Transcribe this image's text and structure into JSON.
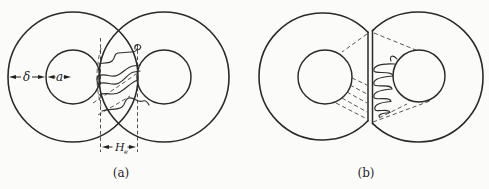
{
  "figure": {
    "background_color": "#fbfbf9",
    "line_color": "#2a2a2a",
    "text_color": "#1f1f1f",
    "panel_a": {
      "caption": "(a)",
      "shell_thickness_label": "δ",
      "core_radius_label": "a",
      "interdiffusion_width_label": "H",
      "interdiffusion_width_subscript": "e"
    },
    "panel_b": {
      "caption": "(b)"
    }
  }
}
